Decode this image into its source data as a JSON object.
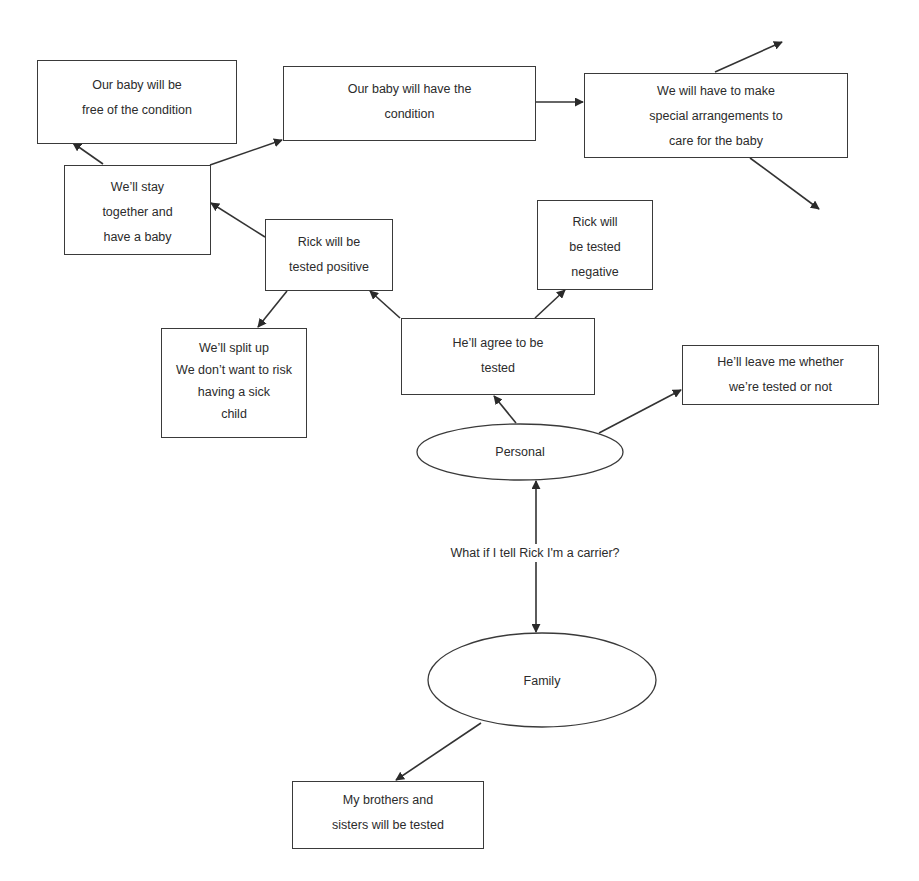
{
  "diagram": {
    "central_question": "What if I tell Rick I'm a carrier?",
    "ellipses": {
      "personal": {
        "label": "Personal"
      },
      "family": {
        "label": "Family"
      }
    },
    "nodes": {
      "baby_free": {
        "lines": [
          "Our baby will be",
          "free of the condition"
        ]
      },
      "baby_has": {
        "lines": [
          "Our baby will have the",
          "condition"
        ]
      },
      "special_arrangements": {
        "lines": [
          "We will have to make",
          "special arrangements to",
          "care for the baby"
        ]
      },
      "stay_together": {
        "lines": [
          "We’ll stay",
          "together and",
          "have a baby"
        ]
      },
      "tested_positive": {
        "lines": [
          "Rick will be",
          "tested positive"
        ]
      },
      "tested_negative": {
        "lines": [
          "Rick will",
          "be tested",
          "negative"
        ]
      },
      "split_up": {
        "lines": [
          "We’ll split up",
          "We don’t want to risk",
          "having a sick",
          "child"
        ]
      },
      "agree_tested": {
        "lines": [
          "He’ll agree to be",
          "tested"
        ]
      },
      "leave_me": {
        "lines": [
          "He’ll leave me whether",
          "we’re  tested or not"
        ]
      },
      "siblings_tested": {
        "lines": [
          "My brothers and",
          "sisters will be tested"
        ]
      }
    },
    "edges": [
      {
        "from": "personal",
        "to": "family",
        "type": "bidirectional"
      },
      {
        "from": "personal",
        "to": "agree_tested"
      },
      {
        "from": "personal",
        "to": "leave_me"
      },
      {
        "from": "agree_tested",
        "to": "tested_positive"
      },
      {
        "from": "agree_tested",
        "to": "tested_negative"
      },
      {
        "from": "tested_positive",
        "to": "stay_together"
      },
      {
        "from": "tested_positive",
        "to": "split_up"
      },
      {
        "from": "stay_together",
        "to": "baby_free"
      },
      {
        "from": "stay_together",
        "to": "baby_has"
      },
      {
        "from": "baby_has",
        "to": "special_arrangements"
      },
      {
        "from": "special_arrangements",
        "to": "(unlabeled, up-right)"
      },
      {
        "from": "special_arrangements",
        "to": "(unlabeled, down-right)"
      },
      {
        "from": "family",
        "to": "siblings_tested"
      }
    ],
    "colors": {
      "stroke": "#3a3a3a",
      "text": "#2b2b2b",
      "background": "#ffffff"
    }
  }
}
